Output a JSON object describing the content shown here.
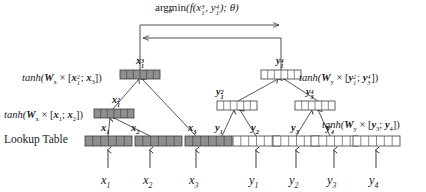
{
  "figure": {
    "objective": {
      "op": "argmin",
      "op_subscript": "θ",
      "expr_open": "(f(",
      "arg1_base": "x",
      "arg1_sub": "1",
      "arg1_sup": "3",
      "sep": ", ",
      "arg2_base": "y",
      "arg2_sub": "1",
      "arg2_sup": "4",
      "expr_close": "); θ)"
    },
    "labels": {
      "lookup_table": "Lookup Table",
      "left_upper": "tanh(𝑾ₓ × [𝒙₁²; 𝒙₃])",
      "left_lower": "tanh(𝑾ₓ × [𝒙₁; 𝒙₂])",
      "right_upper": "tanh(𝑾ᵧ × [𝒚₁²; 𝒚₃⁴])",
      "right_lower": "tanh(𝑾ᵧ × [𝒚₃; 𝒚₄])"
    },
    "equations": {
      "left_upper": {
        "fn": "tanh(",
        "W": "W",
        "Wsub": "x",
        "times": " × [",
        "a_base": "x",
        "a_sub": "1",
        "a_sup": "2",
        "semi": "; ",
        "b_base": "x",
        "b_sub": "3",
        "close": "])"
      },
      "left_lower": {
        "fn": "tanh(",
        "W": "W",
        "Wsub": "x",
        "times": " × [",
        "a_base": "x",
        "a_sub": "1",
        "semi": "; ",
        "b_base": "x",
        "b_sub": "2",
        "close": "])"
      },
      "right_upper": {
        "fn": "tanh(",
        "W": "W",
        "Wsub": "y",
        "times": " × [",
        "a_base": "y",
        "a_sub": "1",
        "a_sup": "2",
        "semi": "; ",
        "b_base": "y",
        "b_sub": "3",
        "b_sup": "4",
        "close": "])"
      },
      "right_lower": {
        "fn": "tanh(",
        "W": "W",
        "Wsub": "y",
        "times": " × [",
        "a_base": "y",
        "a_sub": "3",
        "semi": "; ",
        "b_base": "y",
        "b_sub": "4",
        "close": "])"
      }
    },
    "left_tree": {
      "root": {
        "base": "x",
        "sub": "1",
        "sup": "3",
        "shaded": true,
        "cells": 6
      },
      "mid": {
        "base": "x",
        "sub": "1",
        "sup": "2",
        "shaded": true,
        "cells": 6
      },
      "leaves": [
        {
          "base": "x",
          "sub": "1",
          "shaded": true,
          "cells": 6
        },
        {
          "base": "x",
          "sub": "2",
          "shaded": true,
          "cells": 6
        },
        {
          "base": "x",
          "sub": "3",
          "shaded": true,
          "cells": 6
        }
      ],
      "inputs": [
        {
          "base": "x",
          "sub": "1"
        },
        {
          "base": "x",
          "sub": "2"
        },
        {
          "base": "x",
          "sub": "3"
        }
      ]
    },
    "right_tree": {
      "root": {
        "base": "y",
        "sub": "1",
        "sup": "4",
        "shaded": false,
        "cells": 6
      },
      "mids": [
        {
          "base": "y",
          "sub": "1",
          "sup": "2",
          "shaded": false,
          "cells": 6
        },
        {
          "base": "y",
          "sub": "3",
          "sup": "4",
          "shaded": false,
          "cells": 6
        }
      ],
      "leaves": [
        {
          "base": "y",
          "sub": "1",
          "shaded": false,
          "cells": 6
        },
        {
          "base": "y",
          "sub": "2",
          "shaded": false,
          "cells": 6
        },
        {
          "base": "y",
          "sub": "3",
          "shaded": false,
          "cells": 6
        },
        {
          "base": "y",
          "sub": "4",
          "shaded": false,
          "cells": 6
        }
      ],
      "inputs": [
        {
          "base": "y",
          "sub": "1"
        },
        {
          "base": "y",
          "sub": "2"
        },
        {
          "base": "y",
          "sub": "3"
        },
        {
          "base": "y",
          "sub": "4"
        }
      ]
    },
    "colors": {
      "stroke": "#3a3a3a",
      "shaded_fill": "#8f8f8f",
      "plain_fill": "#ffffff",
      "background": "#ffffff",
      "text": "#1a1a1a"
    }
  }
}
